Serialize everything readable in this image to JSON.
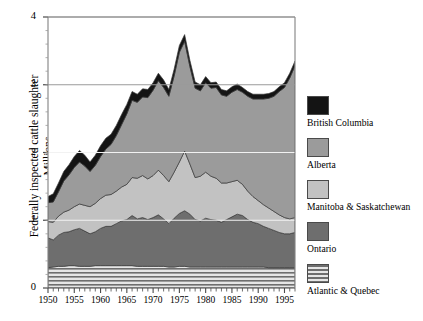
{
  "chart_data": {
    "type": "area",
    "stacked": true,
    "title": "",
    "xlabel": "",
    "ylabel": "Federally inspected cattle slaughter",
    "ylabel2": "Millions",
    "xlim": [
      1950,
      1997
    ],
    "ylim": [
      0,
      4
    ],
    "yticks": [
      0,
      1,
      2,
      3,
      4
    ],
    "xticks": [
      1950,
      1955,
      1960,
      1965,
      1970,
      1975,
      1980,
      1985,
      1990,
      1995
    ],
    "grid": "horizontal-white",
    "legend_position": "right",
    "x": [
      1950,
      1951,
      1952,
      1953,
      1954,
      1955,
      1956,
      1957,
      1958,
      1959,
      1960,
      1961,
      1962,
      1963,
      1964,
      1965,
      1966,
      1967,
      1968,
      1969,
      1970,
      1971,
      1972,
      1973,
      1974,
      1975,
      1976,
      1977,
      1978,
      1979,
      1980,
      1981,
      1982,
      1983,
      1984,
      1985,
      1986,
      1987,
      1988,
      1989,
      1990,
      1991,
      1992,
      1993,
      1994,
      1995,
      1996,
      1997
    ],
    "series": [
      {
        "name": "Atlantic & Quebec",
        "color": "#d8d8d8",
        "pattern": "horizontal-stripes",
        "values": [
          0.3,
          0.31,
          0.32,
          0.32,
          0.33,
          0.33,
          0.32,
          0.32,
          0.32,
          0.33,
          0.33,
          0.33,
          0.33,
          0.33,
          0.33,
          0.33,
          0.33,
          0.32,
          0.32,
          0.32,
          0.32,
          0.32,
          0.32,
          0.31,
          0.31,
          0.32,
          0.32,
          0.31,
          0.31,
          0.31,
          0.31,
          0.31,
          0.31,
          0.31,
          0.31,
          0.31,
          0.31,
          0.31,
          0.31,
          0.31,
          0.31,
          0.31,
          0.3,
          0.3,
          0.3,
          0.3,
          0.3,
          0.3
        ]
      },
      {
        "name": "Ontario",
        "color": "#6e6e6e",
        "pattern": "solid",
        "values": [
          0.44,
          0.4,
          0.46,
          0.5,
          0.5,
          0.53,
          0.56,
          0.52,
          0.48,
          0.5,
          0.55,
          0.58,
          0.58,
          0.62,
          0.66,
          0.68,
          0.74,
          0.7,
          0.72,
          0.69,
          0.72,
          0.76,
          0.7,
          0.64,
          0.72,
          0.78,
          0.82,
          0.78,
          0.7,
          0.68,
          0.72,
          0.7,
          0.69,
          0.66,
          0.7,
          0.74,
          0.78,
          0.76,
          0.7,
          0.66,
          0.64,
          0.6,
          0.58,
          0.55,
          0.52,
          0.5,
          0.5,
          0.52
        ]
      },
      {
        "name": "Manitoba & Saskatchewan",
        "color": "#c2c2c2",
        "pattern": "solid",
        "values": [
          0.24,
          0.26,
          0.28,
          0.3,
          0.32,
          0.34,
          0.36,
          0.38,
          0.4,
          0.42,
          0.44,
          0.46,
          0.47,
          0.48,
          0.5,
          0.52,
          0.56,
          0.6,
          0.62,
          0.6,
          0.62,
          0.66,
          0.64,
          0.62,
          0.68,
          0.76,
          0.88,
          0.74,
          0.62,
          0.66,
          0.68,
          0.64,
          0.62,
          0.58,
          0.54,
          0.52,
          0.5,
          0.46,
          0.42,
          0.38,
          0.34,
          0.32,
          0.3,
          0.28,
          0.26,
          0.24,
          0.22,
          0.22
        ]
      },
      {
        "name": "Alberta",
        "color": "#9b9b9b",
        "pattern": "solid",
        "values": [
          0.28,
          0.3,
          0.36,
          0.46,
          0.52,
          0.58,
          0.62,
          0.58,
          0.52,
          0.56,
          0.62,
          0.68,
          0.74,
          0.82,
          0.92,
          1.04,
          1.14,
          1.12,
          1.16,
          1.2,
          1.26,
          1.32,
          1.3,
          1.26,
          1.42,
          1.62,
          1.62,
          1.44,
          1.32,
          1.26,
          1.32,
          1.3,
          1.34,
          1.3,
          1.28,
          1.32,
          1.34,
          1.36,
          1.4,
          1.44,
          1.5,
          1.56,
          1.62,
          1.7,
          1.82,
          1.92,
          2.08,
          2.24
        ]
      },
      {
        "name": "British Columbia",
        "color": "#141414",
        "pattern": "solid",
        "values": [
          0.09,
          0.12,
          0.13,
          0.14,
          0.15,
          0.16,
          0.17,
          0.16,
          0.14,
          0.15,
          0.16,
          0.16,
          0.15,
          0.15,
          0.15,
          0.14,
          0.13,
          0.12,
          0.12,
          0.12,
          0.11,
          0.11,
          0.11,
          0.1,
          0.1,
          0.1,
          0.1,
          0.09,
          0.09,
          0.09,
          0.09,
          0.08,
          0.08,
          0.08,
          0.08,
          0.08,
          0.08,
          0.07,
          0.07,
          0.07,
          0.07,
          0.07,
          0.07,
          0.07,
          0.07,
          0.07,
          0.07,
          0.07
        ]
      }
    ],
    "totals": [
      1.35,
      1.39,
      1.55,
      1.72,
      1.82,
      1.94,
      2.03,
      1.96,
      1.86,
      1.96,
      2.1,
      2.21,
      2.27,
      2.4,
      2.56,
      2.71,
      2.9,
      2.86,
      2.94,
      2.93,
      3.03,
      3.17,
      3.07,
      2.93,
      3.23,
      3.58,
      3.74,
      3.36,
      3.04,
      3.0,
      3.12,
      3.03,
      3.04,
      2.93,
      2.91,
      2.97,
      3.01,
      2.96,
      2.9,
      2.86,
      2.86,
      2.86,
      2.87,
      2.9,
      2.97,
      3.03,
      3.17,
      3.35
    ]
  },
  "legend": {
    "items": [
      {
        "label": "British Columbia"
      },
      {
        "label": "Alberta"
      },
      {
        "label": "Manitoba & Saskatchewan"
      },
      {
        "label": "Ontario"
      },
      {
        "label": "Atlantic & Quebec"
      }
    ]
  }
}
